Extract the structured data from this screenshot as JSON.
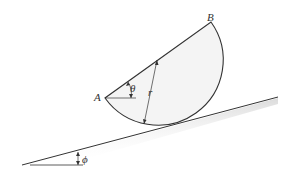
{
  "diagram": {
    "labels": {
      "point_a": "A",
      "point_b": "B",
      "angle_theta": "θ",
      "radius": "r",
      "angle_phi": "ϕ"
    },
    "colors": {
      "stroke": "#333333",
      "fill": "#f4f4f4",
      "shadow": "#bbbbbb"
    }
  }
}
